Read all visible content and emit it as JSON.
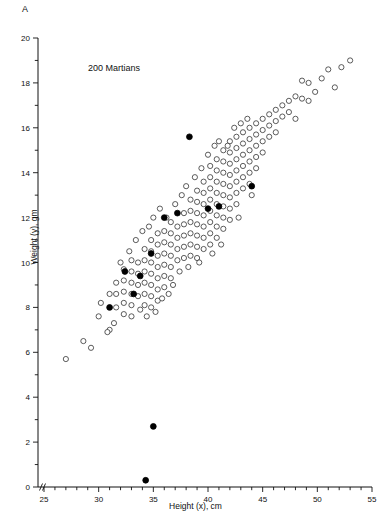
{
  "figure": {
    "panel_letter": "A",
    "annotation": "200 Martians"
  },
  "chart_data": {
    "type": "scatter",
    "title": "",
    "annotation": "200 Martians",
    "panel_label": "A",
    "xlabel": "Height (x), cm",
    "ylabel": "Weight (y), gm",
    "xlim": [
      25,
      55
    ],
    "ylim": [
      0,
      20
    ],
    "x_major_ticks": [
      25,
      30,
      35,
      40,
      45,
      50,
      55
    ],
    "x_tick_labels": [
      "25",
      "30",
      "35",
      "40",
      "45",
      "50",
      "55"
    ],
    "x_minor_step": 1,
    "y_major_ticks": [
      0,
      2,
      4,
      6,
      8,
      10,
      12,
      14,
      16,
      18,
      20
    ],
    "y_tick_labels": [
      "0",
      "2",
      "4",
      "6",
      "8",
      "10",
      "12",
      "14",
      "16",
      "18",
      "20"
    ],
    "grid": false,
    "legend": false,
    "axis_break_x": true,
    "axis_break_y": false,
    "marker_colors": {
      "population": "#ffffff",
      "population_edge": "#333333",
      "sample": "#000000"
    },
    "series": [
      {
        "name": "population",
        "marker": "open-circle",
        "count": 200,
        "points": [
          [
            27.0,
            5.7
          ],
          [
            28.6,
            6.5
          ],
          [
            29.3,
            6.2
          ],
          [
            30.0,
            7.6
          ],
          [
            30.2,
            8.2
          ],
          [
            31.0,
            8.6
          ],
          [
            31.0,
            7.0
          ],
          [
            31.6,
            9.1
          ],
          [
            31.6,
            8.6
          ],
          [
            31.6,
            8.0
          ],
          [
            32.3,
            9.7
          ],
          [
            32.3,
            9.2
          ],
          [
            32.3,
            8.7
          ],
          [
            32.3,
            8.2
          ],
          [
            32.3,
            7.7
          ],
          [
            33.0,
            10.1
          ],
          [
            33.0,
            9.6
          ],
          [
            33.0,
            9.1
          ],
          [
            33.0,
            8.6
          ],
          [
            33.0,
            8.1
          ],
          [
            33.0,
            7.6
          ],
          [
            33.6,
            10.0
          ],
          [
            33.6,
            9.5
          ],
          [
            33.6,
            9.0
          ],
          [
            33.6,
            8.5
          ],
          [
            34.2,
            10.6
          ],
          [
            34.2,
            10.1
          ],
          [
            34.2,
            9.6
          ],
          [
            34.2,
            9.1
          ],
          [
            34.2,
            8.6
          ],
          [
            34.2,
            8.1
          ],
          [
            34.8,
            11.0
          ],
          [
            34.8,
            10.5
          ],
          [
            34.8,
            10.0
          ],
          [
            34.8,
            9.5
          ],
          [
            34.8,
            9.0
          ],
          [
            34.8,
            8.5
          ],
          [
            34.8,
            8.0
          ],
          [
            35.4,
            11.3
          ],
          [
            35.4,
            10.8
          ],
          [
            35.4,
            10.3
          ],
          [
            35.4,
            9.8
          ],
          [
            35.4,
            9.3
          ],
          [
            35.4,
            8.8
          ],
          [
            35.4,
            8.3
          ],
          [
            36.0,
            11.4
          ],
          [
            36.0,
            10.9
          ],
          [
            36.0,
            10.4
          ],
          [
            36.0,
            9.9
          ],
          [
            36.0,
            9.4
          ],
          [
            36.0,
            8.9
          ],
          [
            36.6,
            11.8
          ],
          [
            36.6,
            11.3
          ],
          [
            36.6,
            10.8
          ],
          [
            36.6,
            10.3
          ],
          [
            36.6,
            9.8
          ],
          [
            36.6,
            9.3
          ],
          [
            37.2,
            11.6
          ],
          [
            37.2,
            11.1
          ],
          [
            37.2,
            10.6
          ],
          [
            37.2,
            10.1
          ],
          [
            37.8,
            12.2
          ],
          [
            37.8,
            11.7
          ],
          [
            37.8,
            11.2
          ],
          [
            37.8,
            10.7
          ],
          [
            37.8,
            10.2
          ],
          [
            38.4,
            12.8
          ],
          [
            38.4,
            12.3
          ],
          [
            38.4,
            11.8
          ],
          [
            38.4,
            11.3
          ],
          [
            38.4,
            10.8
          ],
          [
            38.4,
            10.3
          ],
          [
            39.0,
            13.2
          ],
          [
            39.0,
            12.7
          ],
          [
            39.0,
            12.2
          ],
          [
            39.0,
            11.7
          ],
          [
            39.0,
            11.2
          ],
          [
            39.0,
            10.7
          ],
          [
            39.0,
            10.2
          ],
          [
            39.6,
            13.6
          ],
          [
            39.6,
            13.1
          ],
          [
            39.6,
            12.6
          ],
          [
            39.6,
            12.1
          ],
          [
            39.6,
            11.6
          ],
          [
            39.6,
            11.1
          ],
          [
            39.6,
            10.6
          ],
          [
            40.2,
            14.3
          ],
          [
            40.2,
            13.8
          ],
          [
            40.2,
            13.3
          ],
          [
            40.2,
            12.8
          ],
          [
            40.2,
            12.3
          ],
          [
            40.2,
            11.8
          ],
          [
            40.2,
            11.3
          ],
          [
            40.2,
            10.8
          ],
          [
            40.8,
            14.6
          ],
          [
            40.8,
            14.1
          ],
          [
            40.8,
            13.6
          ],
          [
            40.8,
            13.1
          ],
          [
            40.8,
            12.6
          ],
          [
            40.8,
            12.1
          ],
          [
            40.8,
            11.6
          ],
          [
            40.8,
            11.1
          ],
          [
            41.4,
            15.0
          ],
          [
            41.4,
            14.5
          ],
          [
            41.4,
            14.0
          ],
          [
            41.4,
            13.5
          ],
          [
            41.4,
            13.0
          ],
          [
            41.4,
            12.5
          ],
          [
            41.4,
            12.0
          ],
          [
            41.4,
            11.5
          ],
          [
            42.0,
            15.4
          ],
          [
            42.0,
            14.9
          ],
          [
            42.0,
            14.4
          ],
          [
            42.0,
            13.9
          ],
          [
            42.0,
            13.4
          ],
          [
            42.0,
            12.9
          ],
          [
            42.0,
            12.4
          ],
          [
            42.0,
            11.9
          ],
          [
            42.6,
            15.6
          ],
          [
            42.6,
            15.1
          ],
          [
            42.6,
            14.6
          ],
          [
            42.6,
            14.1
          ],
          [
            42.6,
            13.6
          ],
          [
            42.6,
            13.1
          ],
          [
            42.6,
            12.6
          ],
          [
            43.2,
            15.8
          ],
          [
            43.2,
            15.3
          ],
          [
            43.2,
            14.8
          ],
          [
            43.2,
            14.3
          ],
          [
            43.2,
            13.8
          ],
          [
            43.2,
            13.3
          ],
          [
            43.8,
            16.0
          ],
          [
            43.8,
            15.5
          ],
          [
            43.8,
            15.0
          ],
          [
            43.8,
            14.5
          ],
          [
            43.8,
            14.0
          ],
          [
            43.8,
            13.5
          ],
          [
            44.4,
            16.2
          ],
          [
            44.4,
            15.7
          ],
          [
            44.4,
            15.2
          ],
          [
            44.4,
            14.7
          ],
          [
            44.4,
            14.2
          ],
          [
            45.0,
            16.4
          ],
          [
            45.0,
            15.9
          ],
          [
            45.0,
            15.4
          ],
          [
            45.0,
            14.9
          ],
          [
            45.6,
            16.6
          ],
          [
            45.6,
            16.1
          ],
          [
            45.6,
            15.6
          ],
          [
            46.2,
            16.8
          ],
          [
            46.2,
            16.3
          ],
          [
            46.2,
            15.8
          ],
          [
            46.8,
            17.0
          ],
          [
            46.8,
            16.5
          ],
          [
            47.4,
            17.2
          ],
          [
            47.4,
            16.7
          ],
          [
            48.0,
            17.4
          ],
          [
            48.0,
            16.4
          ],
          [
            48.6,
            18.1
          ],
          [
            48.6,
            17.3
          ],
          [
            49.2,
            18.0
          ],
          [
            49.2,
            17.2
          ],
          [
            49.8,
            17.6
          ],
          [
            50.4,
            18.2
          ],
          [
            51.0,
            18.6
          ],
          [
            51.6,
            17.8
          ],
          [
            52.2,
            18.7
          ],
          [
            53.0,
            19.0
          ],
          [
            35.0,
            12.0
          ],
          [
            35.6,
            12.4
          ],
          [
            36.2,
            12.0
          ],
          [
            37.0,
            12.6
          ],
          [
            37.6,
            13.0
          ],
          [
            38.0,
            13.4
          ],
          [
            38.8,
            13.8
          ],
          [
            39.4,
            14.2
          ],
          [
            40.0,
            14.8
          ],
          [
            40.6,
            15.2
          ],
          [
            41.0,
            15.4
          ],
          [
            41.8,
            15.2
          ],
          [
            42.4,
            16.0
          ],
          [
            43.0,
            16.2
          ],
          [
            43.6,
            16.4
          ],
          [
            33.4,
            11.0
          ],
          [
            34.0,
            11.4
          ],
          [
            34.6,
            11.6
          ],
          [
            32.8,
            10.5
          ],
          [
            32.0,
            10.0
          ],
          [
            36.8,
            9.0
          ],
          [
            37.4,
            9.6
          ],
          [
            38.2,
            9.8
          ],
          [
            35.8,
            8.4
          ],
          [
            36.4,
            8.6
          ],
          [
            39.2,
            10.0
          ],
          [
            40.4,
            10.4
          ],
          [
            41.2,
            10.8
          ],
          [
            42.8,
            12.0
          ],
          [
            44.0,
            13.0
          ],
          [
            30.8,
            6.9
          ],
          [
            31.4,
            7.3
          ],
          [
            33.8,
            7.9
          ],
          [
            34.4,
            7.6
          ],
          [
            35.2,
            7.8
          ]
        ]
      },
      {
        "name": "sample",
        "marker": "filled-circle",
        "count": 10,
        "points": [
          [
            31.0,
            8.0
          ],
          [
            32.4,
            9.6
          ],
          [
            33.2,
            8.6
          ],
          [
            33.8,
            9.4
          ],
          [
            34.8,
            10.4
          ],
          [
            35.0,
            2.7
          ],
          [
            36.0,
            12.0
          ],
          [
            37.2,
            12.2
          ],
          [
            38.3,
            15.6
          ],
          [
            40.0,
            12.4
          ],
          [
            41.0,
            12.5
          ],
          [
            44.0,
            13.4
          ],
          [
            34.3,
            0.3
          ]
        ]
      }
    ]
  }
}
